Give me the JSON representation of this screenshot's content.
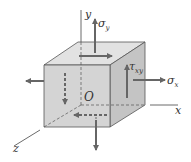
{
  "diagram": {
    "labels": {
      "axis_y": "y",
      "axis_x": "x",
      "axis_z": "z",
      "origin": "O",
      "sigma_y": {
        "symbol": "σ",
        "sub": "y"
      },
      "sigma_x": {
        "symbol": "σ",
        "sub": "x"
      },
      "tau_xy": {
        "symbol": "τ",
        "sub": "xy"
      }
    },
    "colors": {
      "front_face": "#d4d4d4",
      "top_face": "#e2e2e2",
      "right_face": "#c4c4c4",
      "edge": "#555555",
      "arrow": "#666666"
    }
  }
}
